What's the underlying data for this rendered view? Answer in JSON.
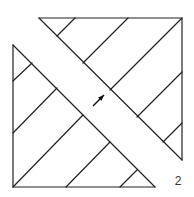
{
  "figure": {
    "label": "2",
    "colors": {
      "line": "#222222",
      "background": "#ffffff",
      "label": "#333333"
    },
    "top_triangle": {
      "outline": [
        [
          39,
          18
        ],
        [
          182,
          18
        ],
        [
          182,
          160
        ]
      ],
      "hatch": [
        [
          [
            75,
            18
          ],
          [
            57,
            36
          ]
        ],
        [
          [
            128,
            18
          ],
          [
            83,
            63
          ]
        ],
        [
          [
            182,
            18
          ],
          [
            110,
            90
          ]
        ],
        [
          [
            182,
            72
          ],
          [
            137,
            117
          ]
        ],
        [
          [
            182,
            123
          ],
          [
            163,
            142
          ]
        ]
      ]
    },
    "bottom_triangle": {
      "outline": [
        [
          13,
          45
        ],
        [
          13,
          187
        ],
        [
          155,
          187
        ]
      ],
      "hatch": [
        [
          [
            32,
            63
          ],
          [
            13,
            81
          ]
        ],
        [
          [
            57,
            88
          ],
          [
            13,
            133
          ]
        ],
        [
          [
            83,
            115
          ],
          [
            13,
            187
          ]
        ],
        [
          [
            110,
            142
          ],
          [
            66,
            187
          ]
        ],
        [
          [
            137,
            170
          ],
          [
            120,
            187
          ]
        ]
      ]
    },
    "arrow": {
      "from": [
        93,
        106
      ],
      "to": [
        104,
        95
      ]
    }
  }
}
